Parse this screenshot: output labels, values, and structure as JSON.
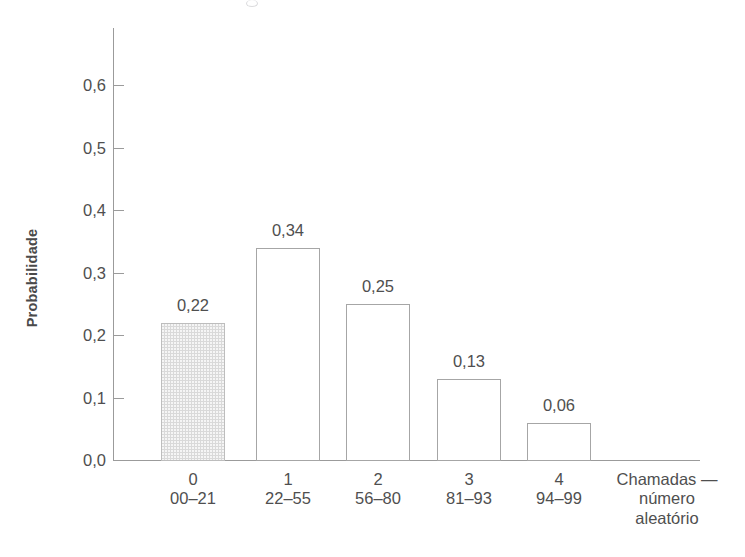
{
  "chart_data": {
    "type": "bar",
    "title": "",
    "subtitle": "",
    "xlabel": "Chamadas — número aleatório",
    "ylabel": "Probabilidade",
    "categories": [
      "0",
      "1",
      "2",
      "3",
      "4"
    ],
    "category_subranges": [
      "00–21",
      "22–55",
      "56–80",
      "81–93",
      "94–99"
    ],
    "values": [
      0.22,
      0.34,
      0.25,
      0.13,
      0.06
    ],
    "value_labels": [
      "0,22",
      "0,34",
      "0,25",
      "0,13",
      "0,06"
    ],
    "ylim": [
      0.0,
      0.65
    ],
    "ytick_values": [
      0.0,
      0.1,
      0.2,
      0.3,
      0.4,
      0.5,
      0.6
    ],
    "ytick_labels": [
      "0,0",
      "0,1",
      "0,2",
      "0,3",
      "0,4",
      "0,5",
      "0,6"
    ],
    "grid": false,
    "legend": false,
    "legend_position": "none",
    "bar_fill_default": "#ffffff",
    "bar_stroke": "#a6a6a6",
    "highlighted_index": 0,
    "highlight_fill": "#d9d9d9",
    "axis_color": "#9b9b9b",
    "text_color": "#4f4f4f",
    "background": "#ffffff"
  },
  "axis_title_x_lines": [
    "Chamadas —",
    "número",
    "aleatório"
  ]
}
